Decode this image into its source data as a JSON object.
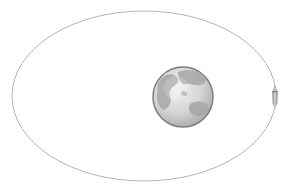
{
  "diagram": {
    "type": "orbit-illustration",
    "orbit": {
      "shape": "ellipse",
      "cx": 144,
      "cy": 96,
      "rx": 132,
      "ry": 85,
      "stroke": "#b0b0b0"
    },
    "planet": {
      "name": "Earth",
      "cx": 183,
      "cy": 97,
      "r": 30,
      "ocean": "#dadada",
      "land": "#a8a8a8",
      "rim": "#7a7a7a"
    },
    "spacecraft": {
      "name": "rocket",
      "x": 275,
      "y": 96,
      "color": "#9a9a9a"
    }
  }
}
